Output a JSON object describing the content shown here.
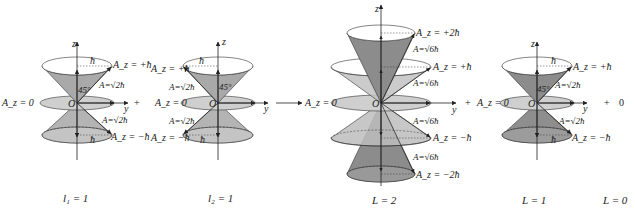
{
  "diagram": {
    "colors": {
      "cone_dark": "#8c8c8c",
      "cone_mid": "#a8a8a8",
      "cone_light": "#c6c6c6",
      "disc": "#cfcfcf",
      "stroke": "#333333",
      "text": "#222222"
    },
    "panels": [
      {
        "id": "l1",
        "caption": "l₁ = 1",
        "axis_z": "z",
        "axis_y": "y",
        "origin": "O",
        "angle": "45°",
        "radius_label": "ħ",
        "labels": {
          "top": "A_z = +ħ",
          "mid": "A_z = 0",
          "bottom": "A_z = −ħ",
          "mag_top": "A=√2ħ",
          "mag_bottom": "A=√2ħ"
        }
      },
      {
        "id": "l2",
        "caption": "l₂ = 1",
        "axis_z": "z",
        "axis_y": "y",
        "origin": "O",
        "angle": "45°",
        "radius_label": "ħ",
        "labels": {
          "top": "A_z = +ħ",
          "mid": "A_z = 0",
          "bottom": "A_z = −ħ",
          "mag_top": "A=√2ħ",
          "mag_bottom": "A=√2ħ"
        }
      },
      {
        "id": "L2",
        "caption": "L = 2",
        "axis_z": "z",
        "axis_y": "y",
        "origin": "O",
        "labels": {
          "plus2": "A_z = +2ħ",
          "plus1": "A_z = +ħ",
          "zero": "A_z = 0",
          "minus1": "A_z = −ħ",
          "minus2": "A_z = −2ħ",
          "mag1": "A=√6ħ",
          "mag2": "A=√6ħ",
          "mag3": "A=√6ħ",
          "mag4": "A=√6ħ"
        }
      },
      {
        "id": "L1",
        "caption": "L = 1",
        "axis_z": "z",
        "axis_y": "y",
        "origin": "O",
        "angle": "45°",
        "radius_label": "ħ",
        "labels": {
          "top": "A_z = +ħ",
          "mid": "A_z = 0",
          "bottom": "A_z = −ħ",
          "mag_top": "A=√2ħ",
          "mag_bottom": "A=√2ħ"
        }
      },
      {
        "id": "L0",
        "caption": "L = 0",
        "value": "0"
      }
    ],
    "operators": {
      "plus1": "+",
      "arrow": "→",
      "plus2": "+",
      "plus3": "+"
    }
  }
}
